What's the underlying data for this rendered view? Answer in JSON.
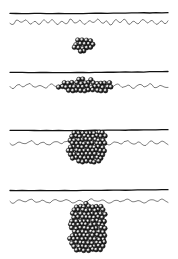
{
  "figure": {
    "title": "Particle cluster growth at a fluid interface",
    "width": 178,
    "height": 259,
    "background_color": "#ffffff",
    "ink_color": "#000000",
    "line_color_thick": "#1a1a1a",
    "line_color_wavy": "#333333",
    "sphere_fill": "#0d0d0d",
    "sphere_highlight": "#ffffff",
    "sphere_radius": 2.3
  },
  "chart_data": {
    "type": "scatter",
    "title": "Particle cluster growth at a fluid interface",
    "xlabel": "",
    "ylabel": "",
    "xlim": [
      0,
      178
    ],
    "ylim": [
      0,
      259
    ],
    "grid": false,
    "legend": "none",
    "panels": [
      {
        "index": 1,
        "label": "a",
        "cluster_shape": "compact-blob",
        "cluster_count": 22,
        "cluster_center_x": 83,
        "cluster_center_y": 45,
        "cluster_width": 22,
        "cluster_height": 16,
        "straight_line_y": 13,
        "wavy_line_y": 22,
        "wavy_amplitude": 2.6,
        "wavy_wavelength": 9,
        "cluster_position": "below-interface-detached"
      },
      {
        "index": 2,
        "label": "b",
        "cluster_shape": "flattened-band",
        "cluster_count": 52,
        "cluster_center_x": 86,
        "cluster_center_y": 86,
        "cluster_width": 56,
        "cluster_height": 13,
        "straight_line_y": 72,
        "wavy_line_y": 86,
        "wavy_amplitude": 2.0,
        "wavy_wavelength": 11,
        "cluster_position": "spread-along-interface"
      },
      {
        "index": 3,
        "label": "c",
        "cluster_shape": "rounded-square",
        "cluster_count": 84,
        "cluster_center_x": 87,
        "cluster_center_y": 146,
        "cluster_width": 38,
        "cluster_height": 34,
        "straight_line_y": 130,
        "wavy_line_y": 143,
        "wavy_amplitude": 2.0,
        "wavy_wavelength": 12,
        "cluster_position": "straddling-interface"
      },
      {
        "index": 4,
        "label": "d",
        "cluster_shape": "tall-column",
        "cluster_count": 132,
        "cluster_center_x": 88,
        "cluster_center_y": 228,
        "cluster_width": 36,
        "cluster_height": 50,
        "straight_line_y": 190,
        "wavy_line_y": 201,
        "wavy_amplitude": 1.8,
        "wavy_wavelength": 12,
        "cluster_position": "hanging-below-interface"
      }
    ],
    "line_x_start": 10,
    "line_x_end": 168,
    "series": [
      {
        "name": "cluster size (number of particles)",
        "x": [
          1,
          2,
          3,
          4
        ],
        "values": [
          22,
          52,
          84,
          132
        ]
      },
      {
        "name": "cluster aspect ratio (w/h)",
        "x": [
          1,
          2,
          3,
          4
        ],
        "values": [
          1.38,
          4.31,
          1.12,
          0.72
        ]
      }
    ],
    "annotations": [
      "Panel 1: small detached blob below the interface",
      "Panel 2: particles spread into a thin band along the interface",
      "Panel 3: compact square aggregate straddling the interface",
      "Panel 4: elongated column hanging beneath the interface"
    ]
  }
}
